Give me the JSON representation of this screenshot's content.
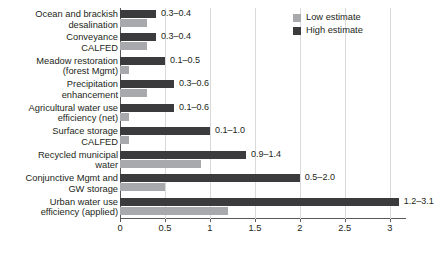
{
  "chart_data": {
    "type": "bar",
    "orientation": "horizontal",
    "title": "",
    "xlabel": "",
    "ylabel": "",
    "xlim": [
      0,
      3.18
    ],
    "xticks": [
      0,
      0.5,
      1,
      1.5,
      2,
      2.5,
      3
    ],
    "xtick_labels": [
      "0",
      "0.5",
      "1",
      "1.5",
      "2",
      "2.5",
      "3"
    ],
    "grid": true,
    "legend_position": "top-right",
    "categories": [
      "Ocean and brackish\ndesalination",
      "Conveyance\nCALFED",
      "Meadow restoration\n(forest Mgmt)",
      "Precipitation\nenhancement",
      "Agricultural water use\nefficiency (net)",
      "Surface storage\nCALFED",
      "Recycled municipal\nwater",
      "Conjunctive Mgmt and\nGW storage",
      "Urban water use\nefficiency (applied)"
    ],
    "series": [
      {
        "name": "Low estimate",
        "color": "#a7a9ac",
        "values": [
          0.3,
          0.3,
          0.1,
          0.3,
          0.1,
          0.1,
          0.9,
          0.5,
          1.2
        ]
      },
      {
        "name": "High estimate",
        "color": "#3b3b3d",
        "values": [
          0.4,
          0.4,
          0.5,
          0.6,
          0.6,
          1.0,
          1.4,
          2.0,
          3.1
        ]
      }
    ],
    "annotations": [
      "0.3–0.4",
      "0.3–0.4",
      "0.1–0.5",
      "0.3–0.6",
      "0.1–0.6",
      "0.1–1.0",
      "0.9–1.4",
      "0.5–2.0",
      "1.2–3.1"
    ]
  },
  "legend": {
    "items": [
      {
        "label": "Low estimate",
        "key": "low"
      },
      {
        "label": "High estimate",
        "key": "high"
      }
    ]
  },
  "colors": {
    "low_estimate": "#a7a9ac",
    "high_estimate": "#3b3b3d",
    "axis": "#58595b",
    "grid": "#d9d9d9",
    "text": "#231f20",
    "background": "#ffffff"
  }
}
